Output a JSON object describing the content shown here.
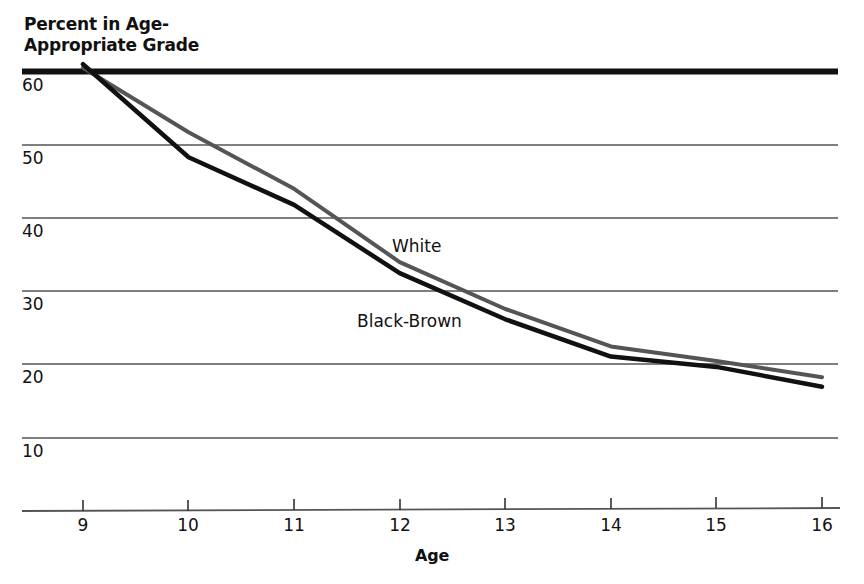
{
  "chart_data": {
    "type": "line",
    "title": "",
    "ylabel": "Percent in Age-\nAppropriate Grade",
    "xlabel": "Age",
    "x": [
      9,
      10,
      11,
      12,
      13,
      14,
      15,
      16
    ],
    "xticklabels": [
      "9",
      "10",
      "11",
      "12",
      "13",
      "14",
      "15",
      "16"
    ],
    "yticklabels": [
      "60",
      "50",
      "40",
      "30",
      "20",
      "10"
    ],
    "yticks": [
      60,
      50,
      40,
      30,
      20,
      10
    ],
    "xlim": [
      8.6,
      16.2
    ],
    "ylim": [
      5,
      62
    ],
    "grid": "horizontal",
    "legend": "inline-labels",
    "series": [
      {
        "name": "White",
        "color": "#555555",
        "values": [
          60.5,
          51.7,
          44.0,
          34.0,
          27.6,
          22.5,
          20.5,
          18.3
        ]
      },
      {
        "name": "Black-Brown",
        "color": "#111111",
        "values": [
          61.0,
          48.3,
          41.8,
          32.5,
          26.2,
          21.1,
          19.7,
          17.0
        ]
      }
    ],
    "annotations": [
      {
        "text": "White",
        "x": 12.25,
        "y": 36.5
      },
      {
        "text": "Black-Brown",
        "x": 11.9,
        "y": 26.5
      }
    ],
    "colors": {
      "background": "#ffffff",
      "text": "#111111",
      "gridline": "#555555",
      "top_rule": "#111111",
      "axis_line": "#555555",
      "white_series": "#555555",
      "black_brown_series": "#111111"
    }
  }
}
